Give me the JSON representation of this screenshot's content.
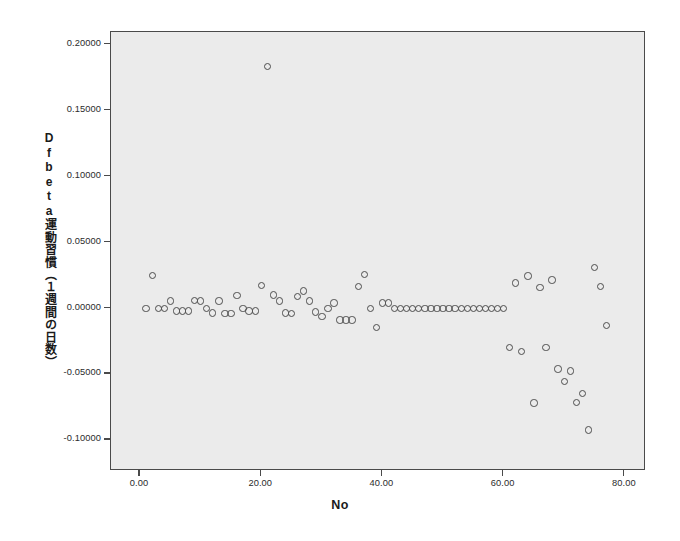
{
  "chart_data": {
    "type": "scatter",
    "title": "",
    "xlabel": "No",
    "ylabel": "Dfbeta運動習慣（１週間の日数）",
    "xlim": [
      -4.8,
      83.5
    ],
    "ylim": [
      -0.1235,
      0.2095
    ],
    "grid": false,
    "legend": null,
    "xticks": [
      "0.00",
      "20.00",
      "40.00",
      "60.00",
      "80.00"
    ],
    "xtick_values": [
      0,
      20,
      40,
      60,
      80
    ],
    "yticks": [
      "0.20000",
      "0.15000",
      "0.10000",
      "0.05000",
      "0.00000",
      "-0.05000",
      "-0.10000"
    ],
    "ytick_values": [
      0.2,
      0.15,
      0.1,
      0.05,
      0,
      -0.05,
      -0.1
    ],
    "marker": "open-circle",
    "marker_color": "#4d4d4d",
    "plot_background": "#ebebeb",
    "figure_background": "#ffffff",
    "points": [
      [
        1.0,
        0.0
      ],
      [
        2.0,
        0.025
      ],
      [
        3.0,
        0.0
      ],
      [
        4.0,
        0.0
      ],
      [
        5.0,
        0.0055
      ],
      [
        6.0,
        -0.002
      ],
      [
        7.0,
        -0.002
      ],
      [
        8.0,
        -0.002
      ],
      [
        9.0,
        0.006
      ],
      [
        10.0,
        0.0055
      ],
      [
        11.0,
        0.0
      ],
      [
        12.0,
        -0.0035
      ],
      [
        13.0,
        0.0055
      ],
      [
        14.0,
        -0.004
      ],
      [
        15.0,
        -0.004
      ],
      [
        16.0,
        0.0095
      ],
      [
        17.0,
        0.0
      ],
      [
        18.0,
        -0.002
      ],
      [
        19.0,
        -0.002
      ],
      [
        20.0,
        0.017
      ],
      [
        21.0,
        0.1835
      ],
      [
        22.0,
        0.01
      ],
      [
        23.0,
        0.0055
      ],
      [
        24.0,
        -0.0035
      ],
      [
        25.0,
        -0.004
      ],
      [
        26.0,
        0.009
      ],
      [
        27.0,
        0.013
      ],
      [
        28.0,
        0.0055
      ],
      [
        29.0,
        -0.003
      ],
      [
        30.0,
        -0.0065
      ],
      [
        31.0,
        0.0
      ],
      [
        32.0,
        0.004
      ],
      [
        33.0,
        -0.009
      ],
      [
        34.0,
        -0.009
      ],
      [
        35.0,
        -0.009
      ],
      [
        36.0,
        0.0165
      ],
      [
        37.0,
        0.0255
      ],
      [
        38.0,
        0.0
      ],
      [
        39.0,
        -0.0145
      ],
      [
        40.0,
        0.004
      ],
      [
        41.0,
        0.004
      ],
      [
        42.0,
        0.0
      ],
      [
        43.0,
        0.0
      ],
      [
        44.0,
        0.0
      ],
      [
        45.0,
        0.0
      ],
      [
        46.0,
        0.0
      ],
      [
        47.0,
        0.0
      ],
      [
        48.0,
        0.0
      ],
      [
        49.0,
        0.0
      ],
      [
        50.0,
        0.0
      ],
      [
        51.0,
        0.0
      ],
      [
        52.0,
        0.0
      ],
      [
        53.0,
        0.0
      ],
      [
        54.0,
        0.0
      ],
      [
        55.0,
        0.0
      ],
      [
        56.0,
        0.0
      ],
      [
        57.0,
        0.0
      ],
      [
        58.0,
        0.0
      ],
      [
        59.0,
        0.0
      ],
      [
        60.0,
        0.0
      ],
      [
        61.0,
        -0.03
      ],
      [
        62.0,
        0.019
      ],
      [
        63.0,
        -0.033
      ],
      [
        64.0,
        0.0245
      ],
      [
        65.0,
        -0.072
      ],
      [
        66.0,
        0.0155
      ],
      [
        67.0,
        -0.03
      ],
      [
        68.0,
        0.0215
      ],
      [
        69.0,
        -0.046
      ],
      [
        70.0,
        -0.0555
      ],
      [
        71.0,
        -0.0475
      ],
      [
        72.0,
        -0.0715
      ],
      [
        73.0,
        -0.0645
      ],
      [
        74.0,
        -0.0925
      ],
      [
        75.0,
        0.031
      ],
      [
        76.0,
        0.0165
      ],
      [
        77.0,
        -0.013
      ]
    ]
  }
}
